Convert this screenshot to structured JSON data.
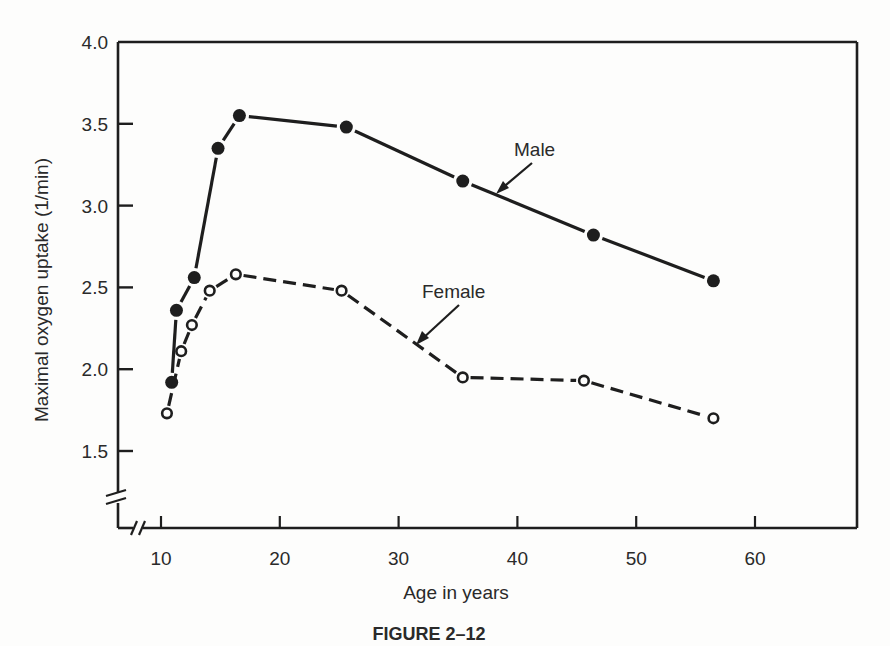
{
  "chart_data": {
    "type": "line",
    "title": "",
    "caption": "FIGURE 2–12",
    "xlabel": "Age in years",
    "ylabel": "Maximal oxygen uptake (1/min)",
    "xlim": [
      7,
      65
    ],
    "ylim": [
      1.0,
      4.0
    ],
    "x_ticks": [
      10,
      20,
      30,
      40,
      50,
      60
    ],
    "x_tick_labels": [
      "10",
      "20",
      "30",
      "40",
      "50",
      "60"
    ],
    "y_ticks": [
      1.5,
      2.0,
      2.5,
      3.0,
      3.5,
      4.0
    ],
    "y_tick_labels": [
      "1.5",
      "2.0",
      "2.5",
      "3.0",
      "3.5",
      "4.0"
    ],
    "axis_breaks": [
      "x",
      "y"
    ],
    "grid": false,
    "legend": "inline arrow labels",
    "series": [
      {
        "name": "Male",
        "style": "solid",
        "marker": "filled-circle",
        "x": [
          10.9,
          11.3,
          12.8,
          14.8,
          16.6,
          25.6,
          35.4,
          46.4,
          56.5
        ],
        "values": [
          1.92,
          2.36,
          2.56,
          3.35,
          3.55,
          3.48,
          3.15,
          2.82,
          2.54
        ]
      },
      {
        "name": "Female",
        "style": "dashed",
        "marker": "open-circle",
        "x": [
          10.5,
          11.7,
          12.6,
          14.1,
          16.3,
          25.2,
          35.4,
          45.6,
          56.5
        ],
        "values": [
          1.73,
          2.11,
          2.27,
          2.48,
          2.58,
          2.48,
          1.95,
          1.93,
          1.7
        ]
      }
    ],
    "annotations": [
      {
        "text": "Male",
        "points_to": "Male series near age 37"
      },
      {
        "text": "Female",
        "points_to": "Female series near age 31"
      }
    ]
  },
  "labels": {
    "xlabel": "Age in years",
    "ylabel": "Maximal oxygen uptake (1/min)",
    "caption": "FIGURE 2–12",
    "male": "Male",
    "female": "Female",
    "x_ticks": [
      "10",
      "20",
      "30",
      "40",
      "50",
      "60"
    ],
    "y_ticks": [
      "1.5",
      "2.0",
      "2.5",
      "3.0",
      "3.5",
      "4.0"
    ]
  },
  "colors": {
    "ink": "#1e1e1e",
    "paper": "#fdfdfc"
  }
}
